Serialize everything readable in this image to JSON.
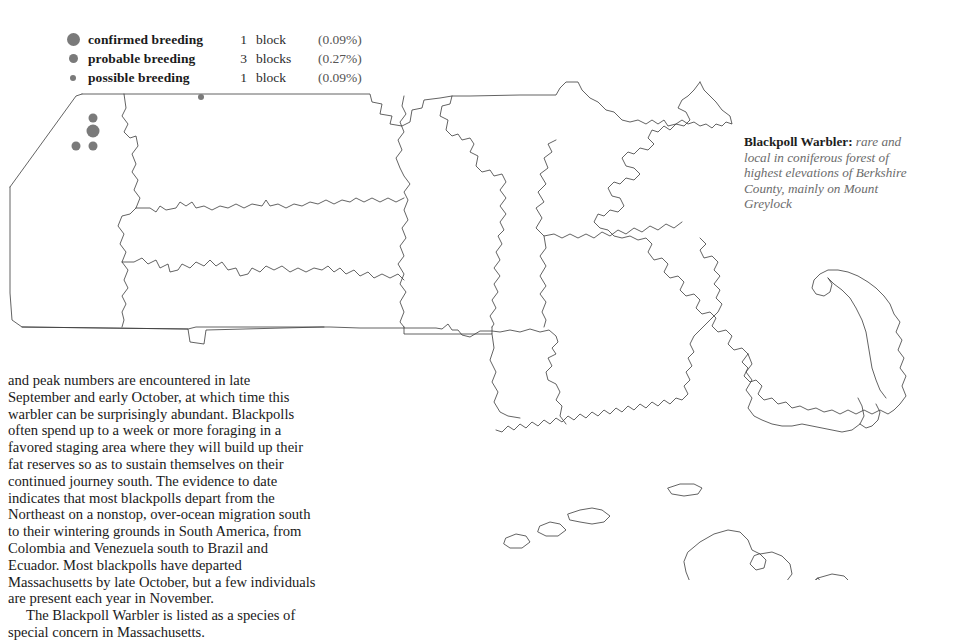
{
  "legend": {
    "rows": [
      {
        "icon": "filled-circle-large",
        "label": "confirmed breeding",
        "count": "1",
        "unit": "block",
        "percent": "(0.09%)",
        "size": 13
      },
      {
        "icon": "filled-circle-medium",
        "label": "probable breeding",
        "count": "3",
        "unit": "blocks",
        "percent": "(0.27%)",
        "size": 9
      },
      {
        "icon": "filled-circle-small",
        "label": "possible breeding",
        "count": "1",
        "unit": "block",
        "percent": "(0.09%)",
        "size": 6
      }
    ]
  },
  "caption": {
    "species": "Blackpoll Warbler:",
    "description": " rare and local in coniferous forest of highest elevations of Berkshire County, mainly on Mount Greylock"
  },
  "body": {
    "paragraph1": "and peak numbers are encountered in late September and early October, at which time this warbler can be surprisingly abundant. Blackpolls often spend up to a week or more foraging in a favored staging area where they will build up their fat reserves so as to sustain themselves on their continued journey south. The evidence to date indicates that most blackpolls depart from the Northeast on a nonstop, over-ocean migration south to their wintering grounds in South America, from Colombia and Venezuela south to Brazil and Ecuador. Most blackpolls have departed Massachusetts by late October, but a few individuals are present each year in November.",
    "paragraph2": "The Blackpoll Warbler is listed as a species of special concern in Massachusetts."
  },
  "map": {
    "region": "Massachusetts",
    "outline_color": "#3b3b3b",
    "dot_color": "#7a7a7a",
    "dots": [
      {
        "category": "probable breeding",
        "x": 93,
        "y": 118,
        "size": 9
      },
      {
        "category": "confirmed breeding",
        "x": 93,
        "y": 131,
        "size": 13
      },
      {
        "category": "probable breeding",
        "x": 93,
        "y": 146,
        "size": 9
      },
      {
        "category": "probable breeding",
        "x": 76,
        "y": 146,
        "size": 9
      },
      {
        "category": "possible breeding",
        "x": 201,
        "y": 97,
        "size": 6
      }
    ]
  }
}
